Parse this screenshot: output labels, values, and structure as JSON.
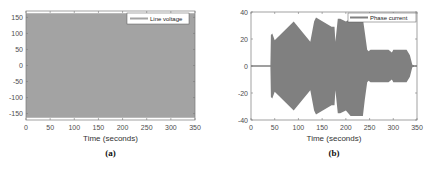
{
  "chart_data": [
    {
      "type": "area",
      "panel": "(a)",
      "title": "",
      "xlabel": "Time (seconds)",
      "ylabel": "",
      "xlim": [
        0,
        350
      ],
      "ylim": [
        -170,
        170
      ],
      "xticks": [
        0,
        50,
        100,
        150,
        200,
        250,
        300,
        350
      ],
      "yticks": [
        150,
        100,
        50,
        0,
        -50,
        -100,
        -150
      ],
      "legend": [
        "Line voltage"
      ],
      "legend_position": "upper right",
      "grid": false,
      "series": [
        {
          "name": "Line voltage",
          "description": "high-frequency oscillation with constant amplitude envelope",
          "x": [
            0,
            350
          ],
          "envelope_upper": [
            163,
            163
          ],
          "envelope_lower": [
            -163,
            -163
          ],
          "color": "#a3a3a3"
        }
      ]
    },
    {
      "type": "area",
      "panel": "(b)",
      "title": "",
      "xlabel": "Time (seconds)",
      "ylabel": "",
      "xlim": [
        0,
        350
      ],
      "ylim": [
        -40,
        40
      ],
      "xticks": [
        0,
        50,
        100,
        150,
        200,
        250,
        300,
        350
      ],
      "yticks": [
        40,
        20,
        0,
        -20,
        -40
      ],
      "legend": [
        "Phase current"
      ],
      "legend_position": "upper right",
      "grid": false,
      "series": [
        {
          "name": "Phase current",
          "description": "high-frequency oscillation with varying amplitude envelope",
          "x": [
            0,
            41,
            42,
            45,
            50,
            90,
            125,
            133,
            137,
            170,
            176,
            178,
            183,
            188,
            200,
            210,
            225,
            236,
            240,
            245,
            248,
            252,
            290,
            297,
            300,
            310,
            328,
            335,
            340,
            345,
            350
          ],
          "envelope_upper": [
            0.5,
            0.5,
            23,
            24,
            19,
            33,
            18,
            33,
            36,
            29,
            29,
            18,
            35,
            35,
            33,
            35,
            35,
            35,
            25,
            12,
            11,
            12,
            12,
            10,
            12,
            12,
            12,
            8,
            1,
            0.5,
            0.5
          ],
          "envelope_lower": [
            -0.5,
            -0.5,
            -23,
            -24,
            -19,
            -33,
            -18,
            -33,
            -36,
            -29,
            -29,
            -18,
            -35,
            -35,
            -33,
            -37,
            -37,
            -37,
            -25,
            -12,
            -11,
            -12,
            -12,
            -10,
            -12,
            -12,
            -12,
            -8,
            -1,
            -0.5,
            -0.5
          ],
          "color": "#808080"
        }
      ]
    }
  ],
  "captions": {
    "a": "(a)",
    "b": "(b)"
  }
}
